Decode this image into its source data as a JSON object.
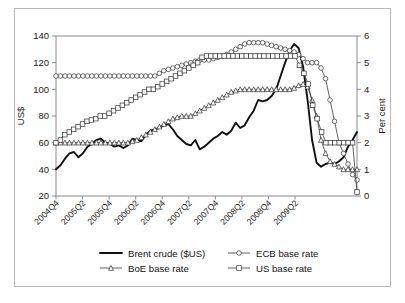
{
  "figure": {
    "border_color": "#b9b9b9",
    "background": "#ffffff"
  },
  "chart_data": {
    "type": "line",
    "title": "",
    "subtitle": "",
    "xlabel": "",
    "ylabel": "US$",
    "y2label": "Per cent",
    "ylim": [
      20,
      140
    ],
    "y2lim": [
      0,
      6
    ],
    "yticks": [
      20,
      40,
      60,
      80,
      100,
      120,
      140
    ],
    "y2ticks": [
      0,
      1,
      2,
      3,
      4,
      5,
      6
    ],
    "grid": false,
    "legend_position": "bottom",
    "x_tick_labels": [
      "2004Q4",
      "2005Q2",
      "2005Q4",
      "2006Q2",
      "2006Q4",
      "2007Q2",
      "2007Q4",
      "2008Q2",
      "2008Q4",
      "2009Q2"
    ],
    "x_tick_indices": [
      0,
      6,
      12,
      18,
      24,
      30,
      36,
      42,
      48,
      54
    ],
    "x_points": 57,
    "series": [
      {
        "name": "Brent crude ($US)",
        "axis": "left",
        "unit": "US$",
        "marker": "none",
        "style": "thick-solid",
        "values": [
          40,
          43,
          48,
          52,
          53,
          49,
          52,
          57,
          59,
          62,
          63,
          60,
          59,
          57,
          58,
          56,
          58,
          63,
          62,
          61,
          66,
          69,
          70,
          71,
          73,
          74,
          70,
          65,
          62,
          59,
          58,
          62,
          55,
          57,
          60,
          63,
          65,
          68,
          66,
          69,
          75,
          71,
          73,
          79,
          84,
          92,
          91,
          92,
          95,
          100,
          110,
          120,
          129,
          134,
          131,
          117,
          92,
          62,
          45,
          42,
          44,
          45,
          44,
          46,
          49,
          57,
          62,
          68
        ]
      },
      {
        "name": "ECB base rate",
        "axis": "right",
        "unit": "per cent",
        "marker": "circle",
        "style": "thin-solid",
        "values": [
          4.5,
          4.5,
          4.5,
          4.5,
          4.5,
          4.5,
          4.5,
          4.5,
          4.5,
          4.5,
          4.5,
          4.5,
          4.5,
          4.5,
          4.5,
          4.5,
          4.5,
          4.5,
          4.5,
          4.5,
          4.5,
          4.5,
          4.5,
          4.6,
          4.7,
          4.75,
          4.8,
          4.85,
          4.9,
          4.95,
          5.0,
          5.05,
          5.1,
          5.1,
          5.1,
          5.15,
          5.2,
          5.25,
          5.3,
          5.4,
          5.5,
          5.6,
          5.7,
          5.75,
          5.75,
          5.75,
          5.75,
          5.7,
          5.65,
          5.6,
          5.55,
          5.5,
          5.45,
          5.4,
          5.3,
          5.15,
          5.0,
          5.0,
          5.0,
          4.8,
          4.4,
          3.6,
          2.8,
          2.0,
          1.6,
          1.2,
          0.8,
          0.6
        ]
      },
      {
        "name": "BoE base rate",
        "axis": "right",
        "unit": "per cent",
        "marker": "triangle",
        "style": "thin-solid",
        "values": [
          2.0,
          2.0,
          2.0,
          2.0,
          2.0,
          2.0,
          2.0,
          2.0,
          2.0,
          2.0,
          2.0,
          2.0,
          2.0,
          2.0,
          2.0,
          2.0,
          2.0,
          2.05,
          2.1,
          2.2,
          2.3,
          2.4,
          2.5,
          2.6,
          2.7,
          2.8,
          2.9,
          2.95,
          3.0,
          3.0,
          3.0,
          3.1,
          3.2,
          3.3,
          3.4,
          3.5,
          3.6,
          3.7,
          3.8,
          3.9,
          3.95,
          4.0,
          4.0,
          4.0,
          4.0,
          4.0,
          4.0,
          4.0,
          4.0,
          4.0,
          4.0,
          4.0,
          4.0,
          4.05,
          4.15,
          4.2,
          4.1,
          3.6,
          3.0,
          2.1,
          1.6,
          1.3,
          1.2,
          1.1,
          1.0,
          1.0,
          1.0,
          1.0
        ]
      },
      {
        "name": "US base rate",
        "axis": "right",
        "unit": "per cent",
        "marker": "square",
        "style": "thin-solid",
        "values": [
          2.0,
          2.1,
          2.3,
          2.4,
          2.5,
          2.6,
          2.7,
          2.8,
          2.85,
          2.9,
          3.0,
          3.0,
          3.1,
          3.2,
          3.3,
          3.4,
          3.5,
          3.6,
          3.7,
          3.8,
          3.9,
          4.0,
          4.0,
          4.1,
          4.2,
          4.3,
          4.4,
          4.5,
          4.6,
          4.7,
          4.8,
          4.9,
          5.0,
          5.2,
          5.25,
          5.25,
          5.25,
          5.25,
          5.25,
          5.25,
          5.25,
          5.25,
          5.25,
          5.25,
          5.25,
          5.25,
          5.25,
          5.25,
          5.25,
          5.25,
          5.25,
          5.25,
          5.25,
          5.25,
          5.25,
          4.9,
          4.6,
          4.2,
          3.4,
          2.9,
          2.4,
          2.0,
          2.0,
          2.0,
          2.0,
          2.0,
          2.0,
          2.0,
          0.15
        ]
      }
    ]
  },
  "legend": {
    "entries": [
      {
        "label": "Brent crude ($US)",
        "marker": "line"
      },
      {
        "label": "ECB base rate",
        "marker": "circle"
      },
      {
        "label": "BoE base rate",
        "marker": "triangle"
      },
      {
        "label": "US base rate",
        "marker": "square"
      }
    ]
  },
  "axes": {
    "left_title": "US$",
    "right_title": "Per cent"
  }
}
